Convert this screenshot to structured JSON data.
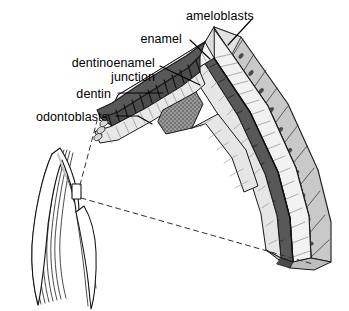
{
  "figure": {
    "type": "histology-diagram",
    "background_color": "#ffffff",
    "labels": [
      {
        "id": "ameloblasts",
        "text": "ameloblasts",
        "x": 186,
        "y": 10,
        "align": "left"
      },
      {
        "id": "enamel",
        "text": "enamel",
        "x": 182,
        "y": 33,
        "align": "right"
      },
      {
        "id": "dentinoenamel",
        "text": "dentinoenamel",
        "x": 155,
        "y": 57,
        "align": "right"
      },
      {
        "id": "junction",
        "text": "junction",
        "x": 155,
        "y": 71,
        "align": "right"
      },
      {
        "id": "dentin",
        "text": "dentin",
        "x": 111,
        "y": 88,
        "align": "right"
      },
      {
        "id": "odontoblasts",
        "text": "odontoblasts",
        "x": 108,
        "y": 111,
        "align": "right"
      }
    ],
    "colors": {
      "outline": "#1a1a1a",
      "enamel_prism": "#f2f2f2",
      "enamel_prism_shade": "#d8d8d8",
      "ameloblast_body": "#c9c9c9",
      "ameloblast_top": "#dedede",
      "nucleus": "#4a4a4a",
      "dentin": "#585858",
      "dentin_stripe": "#171717",
      "dentin_edge": "#3a3a3a",
      "odontoblast": "#e6e6e6",
      "odontoblast_shade": "#b9b9b9",
      "stipple_block": "#9a9a9a",
      "pulp_fill": "#ffffff",
      "dash_line": "#333333",
      "leader_line": "#000000"
    },
    "structures": [
      {
        "name": "ameloblast-layer",
        "description": "outer row of columnar cells with dark oval nuclei"
      },
      {
        "name": "enamel-layer",
        "description": "pale enamel prisms beneath ameloblasts"
      },
      {
        "name": "dentinoenamel-junction",
        "description": "dark boundary line between enamel and dentin"
      },
      {
        "name": "dentin-layer",
        "description": "dark striated band with tubules"
      },
      {
        "name": "odontoblast-layer",
        "description": "pale tubular cell layer lining the pulp side"
      },
      {
        "name": "predentin-block",
        "description": "stippled grey wedge at the inner angle"
      }
    ],
    "inset": {
      "name": "whole-tooth-outline",
      "description": "small longitudinal tooth section with concentric growth contours",
      "callout_box": {
        "x": 72,
        "y": 184,
        "w": 9,
        "h": 15
      },
      "dashed_leaders": 2
    }
  }
}
